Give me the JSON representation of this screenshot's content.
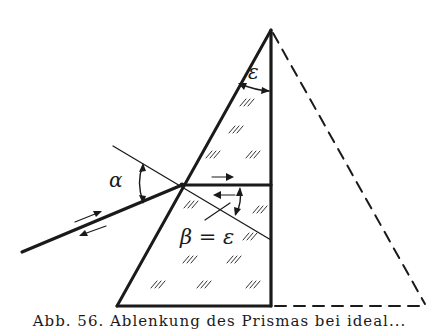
{
  "figure": {
    "labels": {
      "epsilon": "ε",
      "alpha": "α",
      "beta_eq": "β = ε"
    },
    "caption": "Abb. 56. Ablenkung des Prismas bei ideal..."
  },
  "colors": {
    "ink": "#1a1a1a",
    "background": "#ffffff"
  },
  "geometry": {
    "apex": [
      271,
      30
    ],
    "base_left": [
      117,
      306
    ],
    "base_right_solid": [
      271,
      306
    ],
    "dashed_base_end": [
      425,
      306
    ],
    "incident_ray": [
      [
        22,
        252
      ],
      [
        182,
        185
      ]
    ],
    "internal_ray": [
      [
        182,
        185
      ],
      [
        271,
        185
      ]
    ],
    "normal_line": [
      [
        113,
        146
      ],
      [
        271,
        240
      ]
    ]
  }
}
